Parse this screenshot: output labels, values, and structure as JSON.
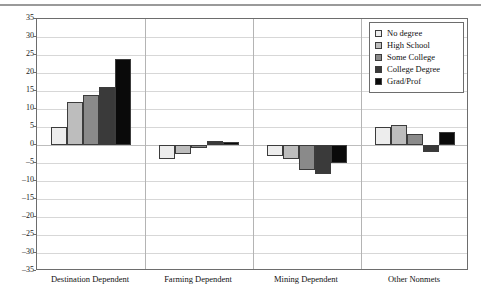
{
  "chart_data": {
    "type": "bar",
    "title": "",
    "subtitle": "",
    "xlabel": "",
    "ylabel": "",
    "ylim": [
      -35,
      35
    ],
    "ytick_step": 5,
    "yticks": [
      "35",
      "30",
      "25",
      "20",
      "15",
      "10",
      "5",
      "0",
      "-5",
      "-10",
      "-15",
      "-20",
      "-25",
      "-30",
      "-35"
    ],
    "grid": true,
    "legend_position": "top-right",
    "categories": [
      "Destination Dependent",
      "Farming Dependent",
      "Mining Dependent",
      "Other Nonmets"
    ],
    "series": [
      {
        "name": "No degree",
        "color": "#ededed",
        "values": [
          5.0,
          -4.0,
          -3.0,
          5.0
        ]
      },
      {
        "name": "High School",
        "color": "#bdbdbd",
        "values": [
          12.0,
          -2.5,
          -4.0,
          5.5
        ]
      },
      {
        "name": "Some College",
        "color": "#8a8a8a",
        "values": [
          14.0,
          -0.5,
          -7.0,
          3.0
        ]
      },
      {
        "name": "College Degree",
        "color": "#3a3a3a",
        "values": [
          16.0,
          1.2,
          -8.0,
          -2.0
        ]
      },
      {
        "name": "Grad/Prof",
        "color": "#0a0a0a",
        "values": [
          24.0,
          0.8,
          -5.0,
          3.5
        ]
      }
    ]
  },
  "legend": {
    "items": [
      {
        "label": "No degree",
        "color": "#ededed"
      },
      {
        "label": "High School",
        "color": "#bdbdbd"
      },
      {
        "label": "Some College",
        "color": "#8a8a8a"
      },
      {
        "label": "College Degree",
        "color": "#3a3a3a"
      },
      {
        "label": "Grad/Prof",
        "color": "#0a0a0a"
      }
    ]
  }
}
